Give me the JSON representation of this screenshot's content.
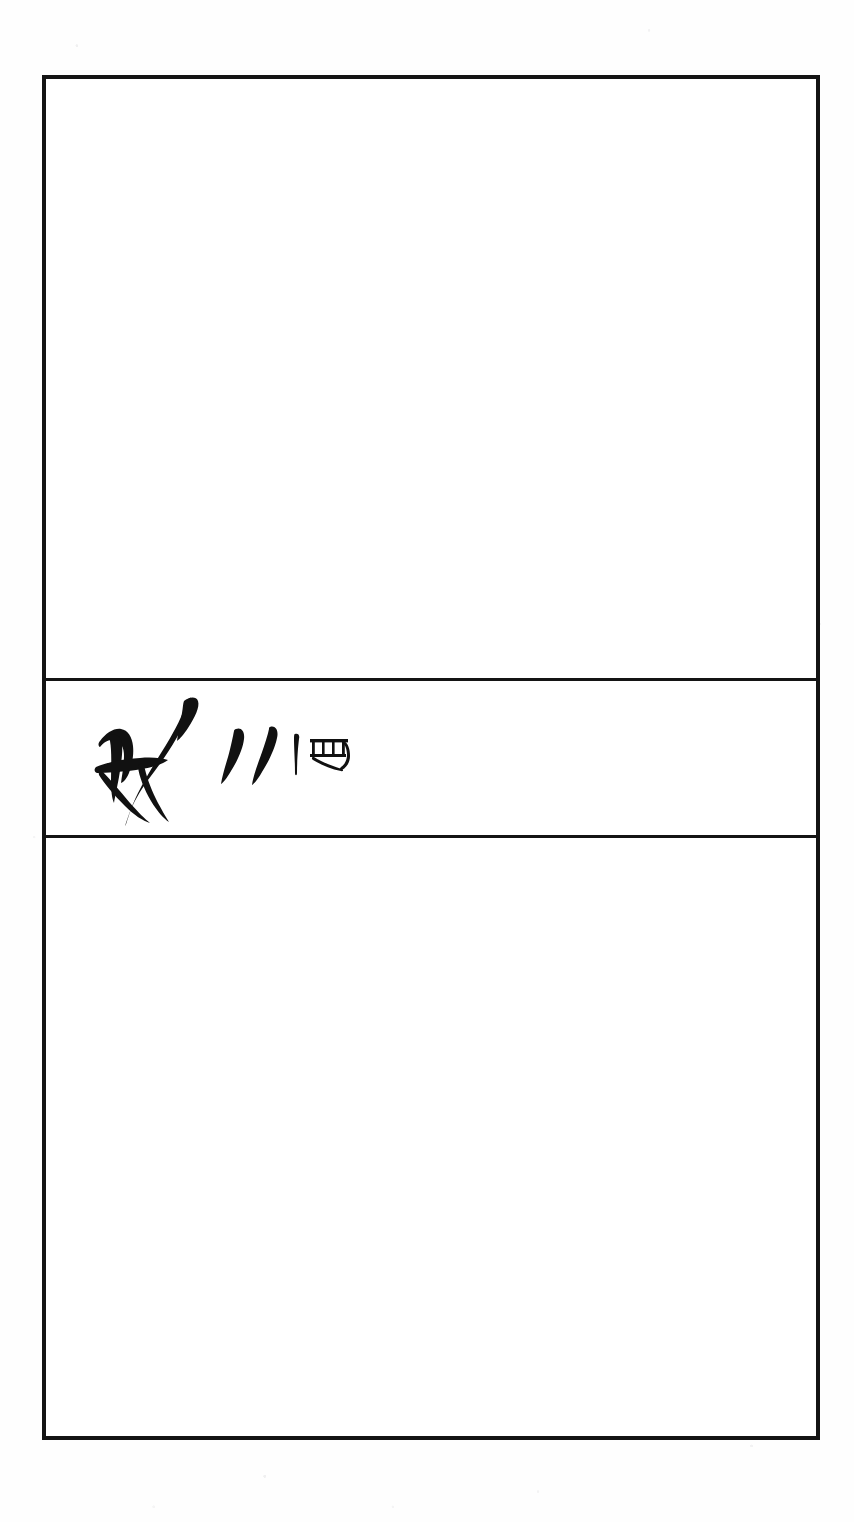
{
  "document": {
    "type": "scanned-page",
    "page_background": "#fefefe",
    "ink_color": "#111111",
    "border_color": "#141414"
  },
  "table": {
    "name": "three-cell-bordered-table",
    "outer_border_width_px": 4,
    "divider_width_px": 3,
    "rows": [
      {
        "id": "row-top",
        "label": "upper-blank-cell",
        "content": "",
        "height_px": 599
      },
      {
        "id": "row-middle",
        "label": "inscription-cell",
        "content": "",
        "height_px": 160
      },
      {
        "id": "row-bottom",
        "label": "lower-blank-cell",
        "content": "",
        "height_px": 597
      }
    ]
  },
  "inscription": {
    "script_style": "seal-script brush calligraphy",
    "glyphs": [
      {
        "id": "glyph-main",
        "name": "brush-calligraphy-glyph",
        "reading": "brush-written seal-script character",
        "stroke_style": "thick tapered brush strokes"
      },
      {
        "id": "glyph-ditto-pair",
        "name": "ditto-stroke-pair",
        "reading": "two comma-shaped repetition strokes",
        "stroke_style": "tapered teardrop strokes"
      },
      {
        "id": "glyph-tally",
        "name": "vertical-tally-stroke",
        "reading": "single vertical stroke",
        "stroke_style": "thin vertical line"
      },
      {
        "id": "glyph-box",
        "name": "box-frame-glyph",
        "reading": "small rectangular frame character with inner divisions",
        "stroke_style": "thin outlined box with vertical bars"
      }
    ]
  }
}
